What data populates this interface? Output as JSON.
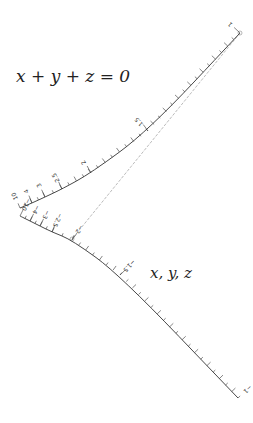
{
  "diagram": {
    "type": "nomogram",
    "title_equation": "x + y + z = 0",
    "scale_label": "x, y, z",
    "colors": {
      "scale_line": "#333333",
      "index_line": "#aaaaaa",
      "background": "#ffffff"
    },
    "upper_branch": {
      "tick_labels": [
        "1",
        "1.5",
        "2",
        "2.5",
        "3",
        "4",
        "10"
      ],
      "ticks": [
        {
          "label": "1",
          "x": 240,
          "y": 33,
          "major": true
        },
        {
          "label": "1.5",
          "x": 148,
          "y": 131,
          "major": true
        },
        {
          "label": "2",
          "x": 91,
          "y": 173,
          "major": true
        },
        {
          "label": "2.5",
          "x": 62,
          "y": 189,
          "major": true
        },
        {
          "label": "3",
          "x": 45,
          "y": 197,
          "major": true
        },
        {
          "label": "4",
          "x": 32,
          "y": 203,
          "major": true
        },
        {
          "label": "10",
          "x": 20,
          "y": 208,
          "major": true
        }
      ]
    },
    "lower_branch": {
      "tick_labels": [
        "-10",
        "-4",
        "-3",
        "-2.5",
        "-2",
        "-1.5",
        "-1"
      ],
      "ticks": [
        {
          "label": "−10",
          "x": 20,
          "y": 216,
          "major": true
        },
        {
          "label": "−4",
          "x": 30,
          "y": 221,
          "major": true
        },
        {
          "label": "−3",
          "x": 40,
          "y": 226,
          "major": true
        },
        {
          "label": "−2.5",
          "x": 52,
          "y": 232,
          "major": true
        },
        {
          "label": "−2",
          "x": 72,
          "y": 240,
          "major": true
        },
        {
          "label": "−1.5",
          "x": 120,
          "y": 275,
          "major": true
        },
        {
          "label": "−1",
          "x": 238,
          "y": 398,
          "major": true
        }
      ]
    },
    "index_line": {
      "from": [
        240,
        33
      ],
      "to": [
        72,
        239
      ]
    }
  }
}
